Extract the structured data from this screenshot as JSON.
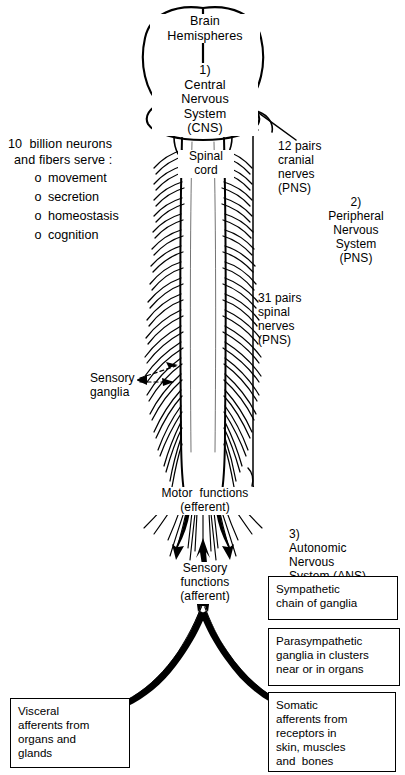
{
  "figure": {
    "type": "anatomical-diagram",
    "background": "#ffffff",
    "ink": "#000000"
  },
  "brain": {
    "hemispheres_label": "Brain\nHemispheres",
    "cns_label": "1)\nCentral\nNervous\nSystem\n(CNS)",
    "spinal_cord_label": "Spinal\ncord"
  },
  "left_panel": {
    "heading_line1": "10  billion neurons",
    "heading_line2": "and fibers serve :",
    "bullet_glyph": "o",
    "items": [
      "movement",
      "secretion",
      "homeostasis",
      "cognition"
    ]
  },
  "right_labels": {
    "cranial_nerves": "12 pairs\ncranial\nnerves\n(PNS)",
    "pns": "2)\nPeripheral\nNervous\nSystem\n(PNS)",
    "spinal_nerves": "31 pairs\nspinal\nnerves\n(PNS)",
    "ans": "3)\nAutonomic\nNervous\nSystem (ANS)"
  },
  "cord_labels": {
    "sensory_ganglia": "Sensory\nganglia",
    "motor_functions": "Motor  functions\n(efferent)",
    "sensory_functions": "Sensory\nfunctions\n(afferent)"
  },
  "boxes": {
    "sympathetic": "Sympathetic\nchain of ganglia",
    "parasympathetic": "Parasympathetic\nganglia in clusters\nnear or in organs",
    "visceral": "Visceral\nafferents from\norgans and\nglands",
    "somatic": "Somatic\nafferents from\nreceptors in\nskin, muscles\nand  bones"
  }
}
